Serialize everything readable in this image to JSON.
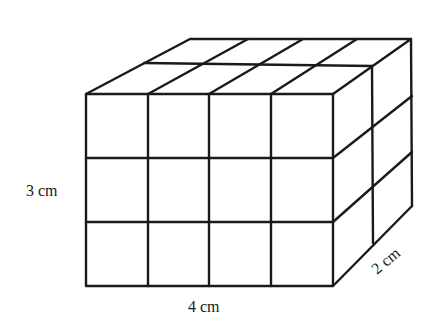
{
  "diagram": {
    "type": "cuboid-unit-cubes",
    "dimensions": {
      "length_units": 4,
      "height_units": 3,
      "depth_units": 2
    },
    "labels": {
      "height": "3 cm",
      "length": "4 cm",
      "depth": "2 cm"
    },
    "colors": {
      "stroke": "#1a1a1a",
      "fill": "#ffffff"
    }
  }
}
